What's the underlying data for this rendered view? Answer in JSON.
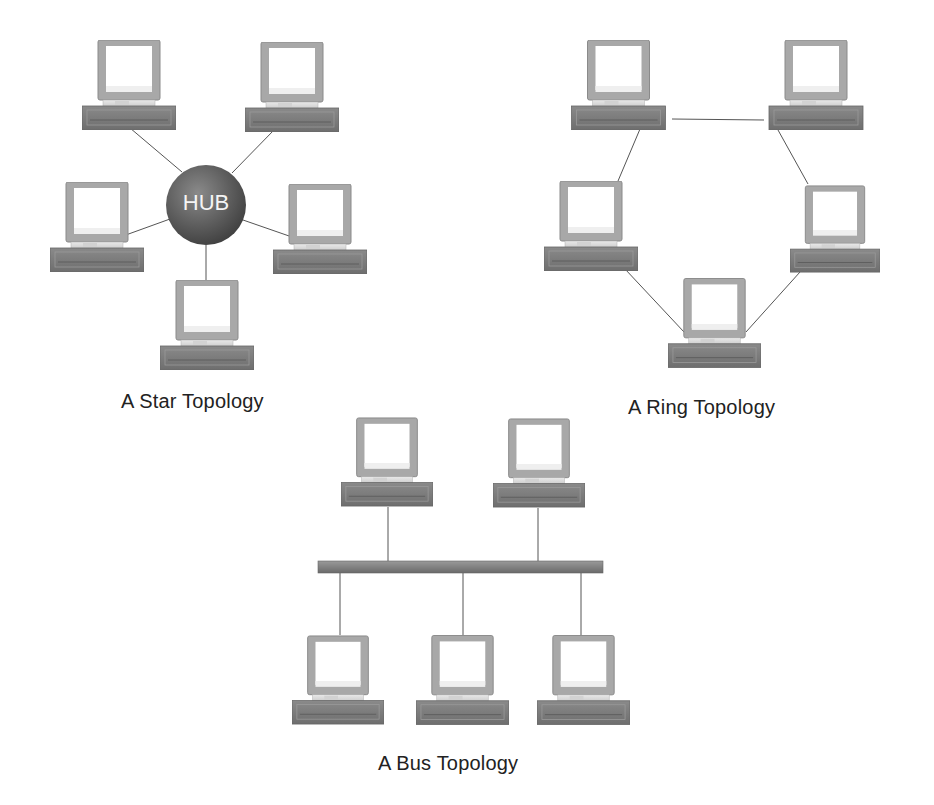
{
  "diagrams": {
    "star": {
      "caption": "A Star Topology",
      "hub_label": "HUB",
      "hub": {
        "cx": 206,
        "cy": 205,
        "r": 40
      },
      "computers": [
        {
          "id": "star-top-left",
          "x": 82,
          "y": 40
        },
        {
          "id": "star-top-right",
          "x": 245,
          "y": 42
        },
        {
          "id": "star-left",
          "x": 50,
          "y": 182
        },
        {
          "id": "star-right",
          "x": 273,
          "y": 184
        },
        {
          "id": "star-bottom",
          "x": 160,
          "y": 280
        }
      ]
    },
    "ring": {
      "caption": "A Ring Topology",
      "computers": [
        {
          "id": "ring-top-left",
          "x": 565,
          "y": 40
        },
        {
          "id": "ring-top-right",
          "x": 764,
          "y": 40
        },
        {
          "id": "ring-left",
          "x": 544,
          "y": 181
        },
        {
          "id": "ring-right",
          "x": 790,
          "y": 184
        },
        {
          "id": "ring-bottom",
          "x": 668,
          "y": 278
        }
      ]
    },
    "bus": {
      "caption": "A Bus Topology",
      "bus_bar": {
        "x1": 318,
        "x2": 603,
        "y": 567
      },
      "computers": [
        {
          "id": "bus-top-left",
          "x": 341,
          "y": 417
        },
        {
          "id": "bus-top-right",
          "x": 493,
          "y": 418
        },
        {
          "id": "bus-bottom-left",
          "x": 292,
          "y": 635
        },
        {
          "id": "bus-bottom-center",
          "x": 416,
          "y": 635
        },
        {
          "id": "bus-bottom-right",
          "x": 537,
          "y": 635
        }
      ]
    }
  },
  "colors": {
    "monitor_frame": "#a9a9a9",
    "monitor_screen": "#ffffff",
    "base": "#7d7d7d",
    "hub": "#5a5a5a",
    "link": "#555555"
  }
}
